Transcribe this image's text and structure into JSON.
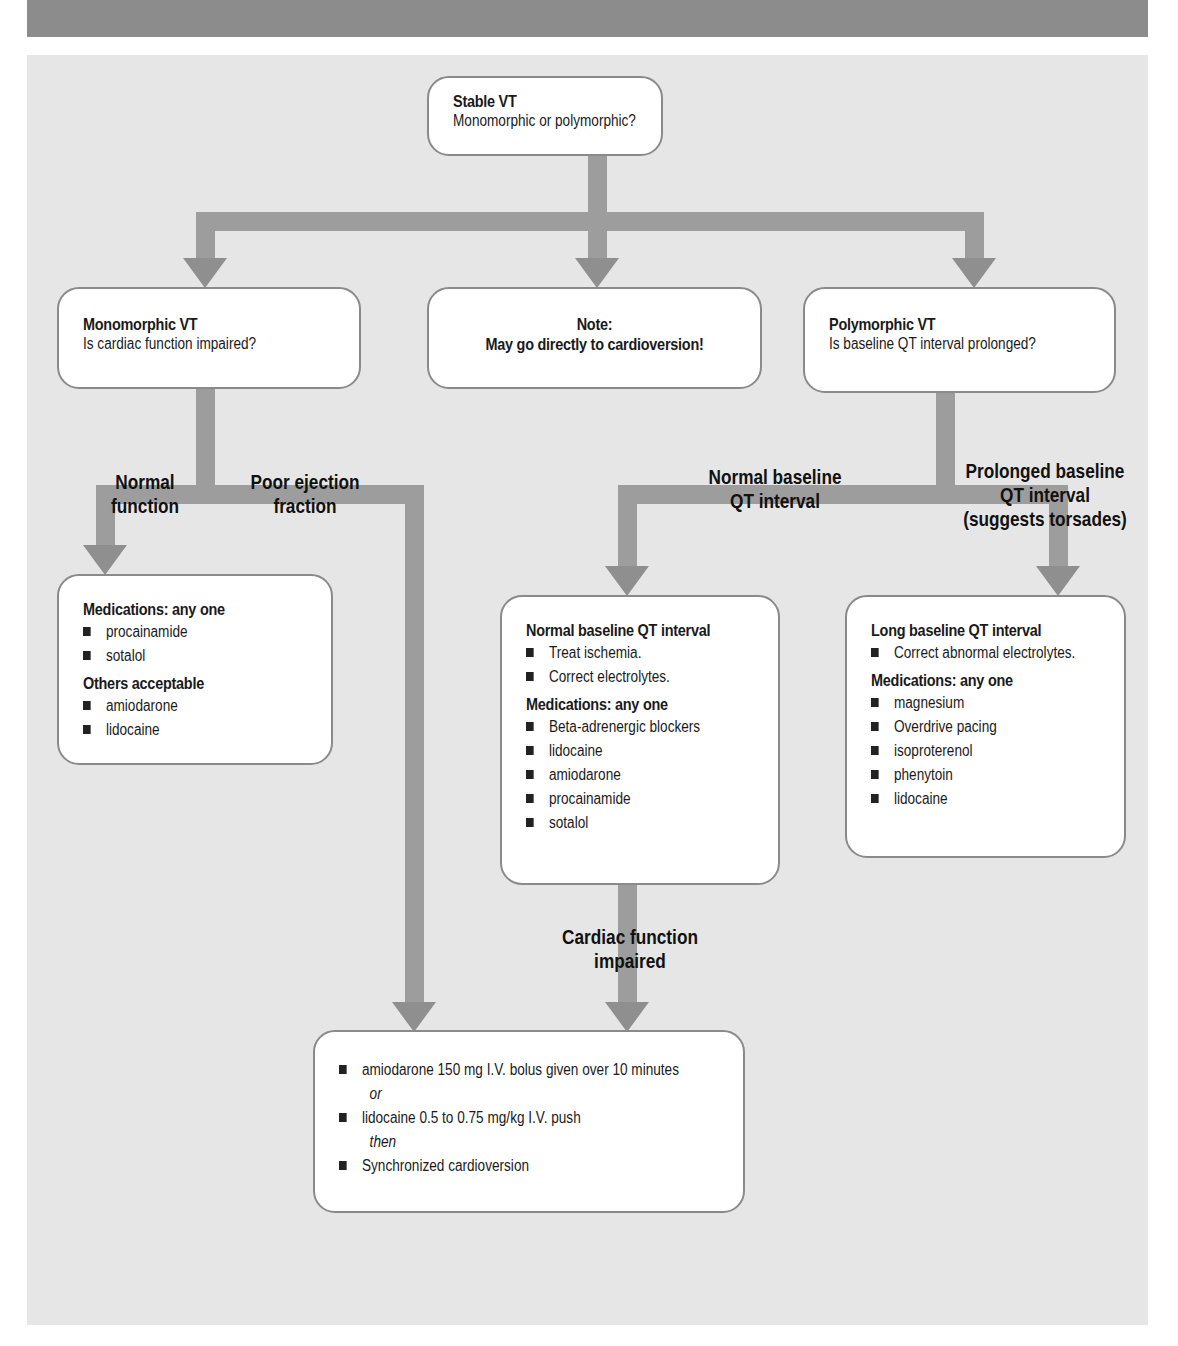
{
  "colors": {
    "background": "#e6e6e6",
    "box_fill": "#ffffff",
    "box_border": "#8a8a8a",
    "arrow": "#9d9d9d",
    "header_bar": "#8c8c8c"
  },
  "start": {
    "title": "Stable VT",
    "question": "Monomorphic or polymorphic?"
  },
  "monomorphic": {
    "title": "Monomorphic VT",
    "question": "Is cardiac function impaired?"
  },
  "note": {
    "title": "Note:",
    "text": "May go directly to cardioversion!"
  },
  "polymorphic": {
    "title": "Polymorphic VT",
    "question": "Is baseline QT interval prolonged?"
  },
  "branch_labels": {
    "normal_function": [
      "Normal",
      "function"
    ],
    "poor_ejection": [
      "Poor ejection",
      "fraction"
    ],
    "normal_qt": [
      "Normal baseline",
      "QT interval"
    ],
    "prolonged_qt": [
      "Prolonged baseline",
      "QT interval",
      "(suggests torsades)"
    ],
    "cardiac_impaired": [
      "Cardiac function",
      "impaired"
    ]
  },
  "mono_normal_box": {
    "heading1": "Medications: any one",
    "list1": [
      "procainamide",
      "sotalol"
    ],
    "heading2": "Others acceptable",
    "list2": [
      "amiodarone",
      "lidocaine"
    ]
  },
  "normal_qt_box": {
    "heading1": "Normal baseline QT interval",
    "list1": [
      "Treat ischemia.",
      "Correct electrolytes."
    ],
    "heading2": "Medications: any one",
    "list2": [
      "Beta-adrenergic blockers",
      "lidocaine",
      "amiodarone",
      "procainamide",
      "sotalol"
    ]
  },
  "long_qt_box": {
    "heading1": "Long baseline QT interval",
    "list1": [
      "Correct abnormal electrolytes."
    ],
    "heading2": "Medications: any one",
    "list2": [
      "magnesium",
      "Overdrive pacing",
      "isoproterenol",
      "phenytoin",
      "lidocaine"
    ]
  },
  "final_box": {
    "item1": "amiodarone 150 mg I.V. bolus given over 10 minutes",
    "connector1": "or",
    "item2": "lidocaine 0.5 to 0.75 mg/kg I.V. push",
    "connector2": "then",
    "item3": "Synchronized cardioversion"
  }
}
